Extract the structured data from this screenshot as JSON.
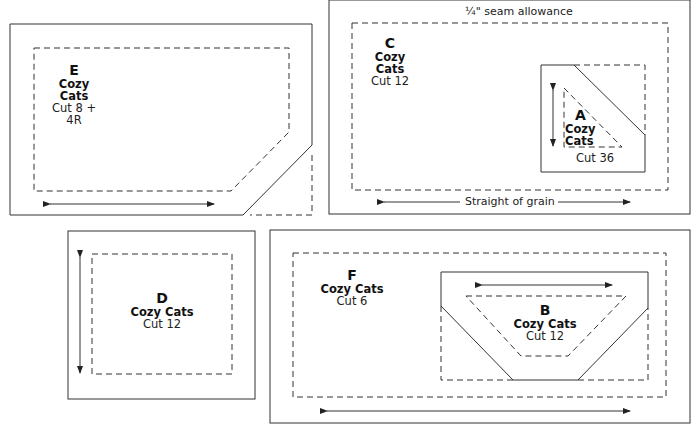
{
  "seam_note": "¼\" seam allowance",
  "grain_note": "Straight of grain",
  "pieces": {
    "E": {
      "letter": "E",
      "name": "Cozy Cats",
      "cut": "Cut 8 + 4R"
    },
    "C": {
      "letter": "C",
      "name": "Cozy Cats",
      "cut": "Cut 12"
    },
    "A": {
      "letter": "A",
      "name_line1": "Cozy",
      "name_line2": "Cats",
      "cut": "Cut 36"
    },
    "D": {
      "letter": "D",
      "name": "Cozy Cats",
      "cut": "Cut 12"
    },
    "F": {
      "letter": "F",
      "name": "Cozy Cats",
      "cut": "Cut 6"
    },
    "B": {
      "letter": "B",
      "name": "Cozy Cats",
      "cut": "Cut 12"
    }
  },
  "colors": {
    "line": "#333333",
    "background": "#ffffff"
  }
}
